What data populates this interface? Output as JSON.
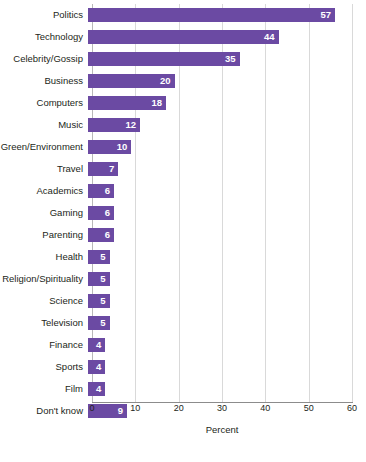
{
  "chart_data": {
    "type": "bar",
    "orientation": "horizontal",
    "title": "",
    "subtitle": "",
    "xlabel": "Percent",
    "ylabel": "",
    "xlim": [
      0,
      60
    ],
    "xticks": [
      0,
      10,
      20,
      30,
      40,
      50,
      60
    ],
    "grid": true,
    "legend": false,
    "bar_color": "#6b4aa3",
    "value_label_color": "#ffffff",
    "categories": [
      "Politics",
      "Technology",
      "Celebrity/Gossip",
      "Business",
      "Computers",
      "Music",
      "Green/Environment",
      "Travel",
      "Academics",
      "Gaming",
      "Parenting",
      "Health",
      "Religion/Spirituality",
      "Science",
      "Television",
      "Finance",
      "Sports",
      "Film",
      "Don't know"
    ],
    "values": [
      57,
      44,
      35,
      20,
      18,
      12,
      10,
      7,
      6,
      6,
      6,
      5,
      5,
      5,
      5,
      4,
      4,
      4,
      9
    ]
  }
}
